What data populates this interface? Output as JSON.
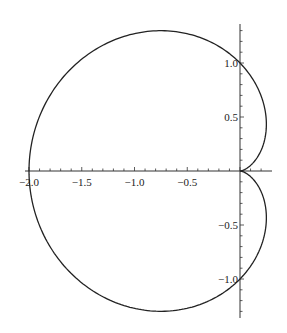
{
  "chart_data": {
    "type": "line",
    "title": "",
    "xlabel": "",
    "ylabel": "",
    "xlim": [
      -2.0,
      0.25
    ],
    "ylim": [
      -1.3,
      1.3
    ],
    "grid": false,
    "x_ticks": [
      -2.0,
      -1.5,
      -1.0,
      -0.5
    ],
    "x_tick_labels": [
      "-2.0",
      "-1.5",
      "-1.0",
      "-0.5"
    ],
    "y_ticks": [
      1.0,
      0.5,
      -0.5,
      -1.0
    ],
    "y_tick_labels": [
      "1.0",
      "0.5",
      "-0.5",
      "-1.0"
    ],
    "series": [
      {
        "name": "cardioid",
        "equation": "r = 1 - cos(theta)",
        "color": "#222222",
        "key_points": [
          [
            0,
            0
          ],
          [
            -0.75,
            1.299
          ],
          [
            -2.0,
            0
          ],
          [
            -0.75,
            -1.299
          ],
          [
            0.25,
            0.433
          ],
          [
            0.25,
            -0.433
          ],
          [
            0,
            1
          ],
          [
            0,
            -1
          ]
        ]
      }
    ]
  }
}
